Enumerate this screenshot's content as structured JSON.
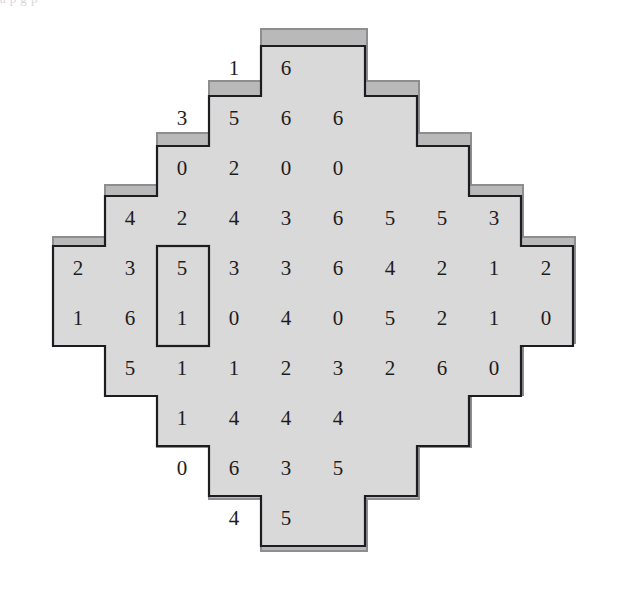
{
  "figure": {
    "kind": "numeric-diamond-grid",
    "page_scrap_text": "a                                          p                    g        p",
    "colors": {
      "outer_band": "#8e8e90",
      "inner_band": "#b9b9ba",
      "cell_fill": "#d9d9d9",
      "border": "#1d1d21",
      "digit": "#1d1d21",
      "page_background": "#ffffff"
    },
    "geometry": {
      "columns": 10,
      "rows": 10,
      "cell_width": 52,
      "cell_height": 50,
      "origin_x": 52,
      "origin_y": 46,
      "outer_band_width": 18,
      "inner_band_width": 16,
      "border_width": 2
    },
    "grid": {
      "rows": [
        {
          "index": 1,
          "start_col": 4,
          "end_col": 5,
          "values": [
            1,
            6
          ]
        },
        {
          "index": 2,
          "start_col": 3,
          "end_col": 6,
          "values": [
            3,
            5,
            6,
            6
          ]
        },
        {
          "index": 3,
          "start_col": 3,
          "end_col": 6,
          "values": [
            0,
            2,
            0,
            0
          ]
        },
        {
          "index": 4,
          "start_col": 2,
          "end_col": 9,
          "values": [
            4,
            2,
            4,
            3,
            6,
            5,
            5,
            3
          ]
        },
        {
          "index": 5,
          "start_col": 1,
          "end_col": 10,
          "values": [
            2,
            3,
            5,
            3,
            3,
            6,
            4,
            2,
            1,
            2
          ]
        },
        {
          "index": 6,
          "start_col": 1,
          "end_col": 10,
          "values": [
            1,
            6,
            1,
            0,
            4,
            0,
            5,
            2,
            1,
            0
          ]
        },
        {
          "index": 7,
          "start_col": 2,
          "end_col": 9,
          "values": [
            5,
            1,
            1,
            2,
            3,
            2,
            6,
            0
          ]
        },
        {
          "index": 8,
          "start_col": 3,
          "end_col": 6,
          "values": [
            1,
            4,
            4,
            4
          ]
        },
        {
          "index": 9,
          "start_col": 3,
          "end_col": 6,
          "values": [
            0,
            6,
            3,
            5
          ]
        },
        {
          "index": 10,
          "start_col": 4,
          "end_col": 5,
          "values": [
            4,
            5
          ]
        }
      ]
    },
    "highlight": {
      "label": "selected-domino",
      "col": 3,
      "row_start": 5,
      "row_end": 6,
      "values": [
        5,
        1
      ]
    }
  }
}
